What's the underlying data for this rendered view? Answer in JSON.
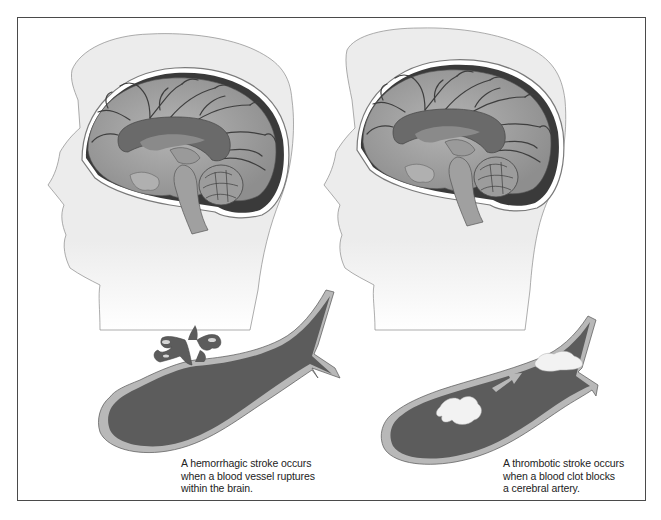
{
  "figure": {
    "panels": [
      {
        "id": "hemorrhagic",
        "caption_lines": [
          "A hemorrhagic stroke occurs",
          "when a blood vessel ruptures",
          "within the brain."
        ]
      },
      {
        "id": "thrombotic",
        "caption_lines": [
          "A thrombotic stroke occurs",
          "when a blood clot blocks",
          "a cerebral artery."
        ]
      }
    ]
  },
  "colors": {
    "frame": "#4a4a4a",
    "skin": "#ececec",
    "brain": "#a9a9a9",
    "ventricle": "#6a6a6a",
    "vessel_lumen": "#5c5c5c",
    "vessel_wall": "#b8b8b8",
    "clot": "#f2f2f2"
  }
}
